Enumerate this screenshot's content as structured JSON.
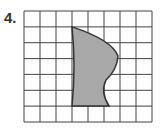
{
  "problem": {
    "number": "4."
  },
  "grid": {
    "cols": 8,
    "rows": 7,
    "line_color": "#444444"
  },
  "shape": {
    "fill": "#a8a8a8",
    "stroke": "#333333",
    "description": "curved irregular shape on grid"
  }
}
